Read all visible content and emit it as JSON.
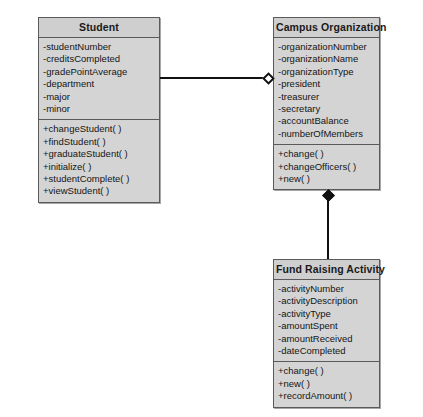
{
  "diagram": {
    "kind": "uml-class-diagram",
    "background_color": "#ffffff",
    "box_fill_color": "#d4d4d4",
    "title_fill_color": "#cfcfcf",
    "border_color": "#5a5a5a",
    "line_color": "#111111",
    "classes": [
      {
        "id": "student",
        "title": "Student",
        "attributes": [
          "-studentNumber",
          "-creditsCompleted",
          "-gradePointAverage",
          "-department",
          "-major",
          "-minor"
        ],
        "operations": [
          "+changeStudent( )",
          "+findStudent( )",
          "+graduateStudent( )",
          "+initialize( )",
          "+studentComplete( )",
          "+viewStudent( )"
        ]
      },
      {
        "id": "campus-organization",
        "title": "Campus Organization",
        "attributes": [
          "-organizationNumber",
          "-organizationName",
          "-organizationType",
          "-president",
          "-treasurer",
          "-secretary",
          "-accountBalance",
          "-numberOfMembers"
        ],
        "operations": [
          "+change( )",
          "+changeOfficers( )",
          "+new( )"
        ]
      },
      {
        "id": "fund-raising-activity",
        "title": "Fund Raising Activity",
        "attributes": [
          "-activityNumber",
          "-activityDescription",
          "-activityType",
          "-amountSpent",
          "-amountReceived",
          "-dateCompleted"
        ],
        "operations": [
          "+change( )",
          "+new( )",
          "+recordAmount( )"
        ]
      }
    ],
    "relationships": [
      {
        "id": "student-to-campus-organization",
        "type": "aggregation",
        "marker": "hollow-diamond",
        "from": "student",
        "to": "campus-organization"
      },
      {
        "id": "campus-organization-to-fund-raising-activity",
        "type": "composition",
        "marker": "filled-diamond",
        "from": "campus-organization",
        "to": "fund-raising-activity"
      }
    ]
  }
}
